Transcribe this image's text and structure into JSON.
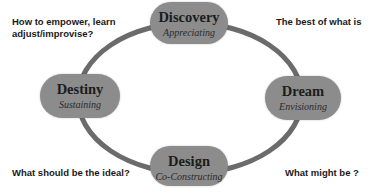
{
  "diagram": {
    "type": "cycle",
    "colors": {
      "ring": "#6b6b6b",
      "pill": "#8c8c8c",
      "text": "#1c1c1c"
    },
    "stages": [
      {
        "name": "Discovery",
        "subtitle": "Appreciating",
        "position": "top"
      },
      {
        "name": "Dream",
        "subtitle": "Envisioning",
        "position": "right"
      },
      {
        "name": "Design",
        "subtitle": "Co-Constructing",
        "position": "bottom"
      },
      {
        "name": "Destiny",
        "subtitle": "Sustaining",
        "position": "left"
      }
    ],
    "notes": {
      "top_left": [
        "How to empower, learn",
        "adjust/improvise?"
      ],
      "top_right": "The best of what is",
      "bottom_left": "What should be the ideal?",
      "bottom_right": "What might be ?"
    }
  }
}
